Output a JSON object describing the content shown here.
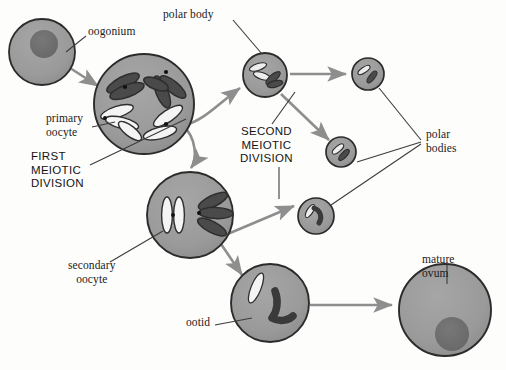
{
  "figure": {
    "caption": "",
    "background": "#fdfdfc"
  },
  "palette": {
    "cell_fill": "#9a9a9a",
    "cell_stroke": "#2b2b2b",
    "nucleus_fill": "#6e6e6e",
    "chromosome_dark": "#3a3a3a",
    "chromosome_light": "#f6f6f6",
    "arrow_gray": "#8e8e8e",
    "leader_line": "#3c3c3c",
    "text": "#1a1a1a"
  },
  "labels": [
    {
      "id": "oogonium",
      "text": "oogonium",
      "x": 88,
      "y": 31,
      "style": "serif",
      "align": "left"
    },
    {
      "id": "primary-oocyte",
      "text": "primary\noocyte",
      "x": 46,
      "y": 118,
      "style": "serif",
      "align": "left"
    },
    {
      "id": "first-division",
      "text": "FIRST\nMEIOTIC\nDIVISION",
      "x": 31,
      "y": 156,
      "style": "caps",
      "align": "left"
    },
    {
      "id": "secondary-oocyte",
      "text": "secondary\noocyte",
      "x": 73,
      "y": 264,
      "style": "serif",
      "align": "center"
    },
    {
      "id": "ootid",
      "text": "ootid",
      "x": 188,
      "y": 321,
      "style": "serif",
      "align": "left"
    },
    {
      "id": "polar-body",
      "text": "polar body",
      "x": 165,
      "y": 13,
      "style": "serif",
      "align": "left"
    },
    {
      "id": "second-division",
      "text": "SECOND\nMEIOTIC\nDIVISION",
      "x": 245,
      "y": 131,
      "style": "caps",
      "align": "left"
    },
    {
      "id": "polar-bodies",
      "text": "polar\nbodies",
      "x": 424,
      "y": 133,
      "style": "serif",
      "align": "left"
    },
    {
      "id": "mature-ovum",
      "text": "mature\novum",
      "x": 422,
      "y": 258,
      "style": "serif",
      "align": "left"
    }
  ],
  "cells": [
    {
      "id": "oogonium-cell",
      "name": "oogonium",
      "cx": 42,
      "cy": 52,
      "r": 33,
      "nucleus": {
        "cx": 44,
        "cy": 44,
        "r": 14
      },
      "chromosomes": "none"
    },
    {
      "id": "primary-oocyte-cell",
      "name": "primary oocyte",
      "cx": 144,
      "cy": 104,
      "r": 50,
      "nucleus": null,
      "chromosomes": "tetrads"
    },
    {
      "id": "secondary-oocyte-cell",
      "name": "secondary oocyte",
      "cx": 190,
      "cy": 215,
      "r": 43,
      "nucleus": null,
      "chromosomes": "dyads"
    },
    {
      "id": "ootid-cell",
      "name": "ootid",
      "cx": 270,
      "cy": 303,
      "r": 39,
      "nucleus": null,
      "chromosomes": "two"
    },
    {
      "id": "mature-ovum-cell",
      "name": "mature ovum",
      "cx": 445,
      "cy": 310,
      "r": 46,
      "nucleus": {
        "cx": 452,
        "cy": 334,
        "r": 17
      },
      "chromosomes": "none"
    },
    {
      "id": "polar-body-1",
      "name": "first polar body",
      "cx": 265,
      "cy": 75,
      "r": 22,
      "nucleus": null,
      "chromosomes": "small"
    },
    {
      "id": "polar-body-2",
      "name": "polar body upper right",
      "cx": 368,
      "cy": 74,
      "r": 16,
      "nucleus": null,
      "chromosomes": "small"
    },
    {
      "id": "polar-body-3",
      "name": "polar body middle",
      "cx": 341,
      "cy": 152,
      "r": 15,
      "nucleus": null,
      "chromosomes": "small"
    },
    {
      "id": "polar-body-4",
      "name": "polar body lower",
      "cx": 316,
      "cy": 216,
      "r": 18,
      "nucleus": null,
      "chromosomes": "small"
    }
  ],
  "flow_arrows": [
    {
      "id": "oogonium-to-primary",
      "from": "oogonium",
      "to": "primary oocyte"
    },
    {
      "id": "primary-to-polar-body-1",
      "from": "primary oocyte",
      "to": "first polar body"
    },
    {
      "id": "primary-to-secondary",
      "from": "primary oocyte",
      "to": "secondary oocyte"
    },
    {
      "id": "polar-body-1-to-polar-body-2",
      "from": "first polar body",
      "to": "polar body upper right"
    },
    {
      "id": "polar-body-1-to-polar-body-3",
      "from": "first polar body",
      "to": "polar body middle"
    },
    {
      "id": "secondary-to-polar-body-4",
      "from": "secondary oocyte",
      "to": "polar body lower"
    },
    {
      "id": "secondary-to-ootid",
      "from": "secondary oocyte",
      "to": "ootid"
    },
    {
      "id": "ootid-to-mature-ovum",
      "from": "ootid",
      "to": "mature ovum"
    }
  ]
}
